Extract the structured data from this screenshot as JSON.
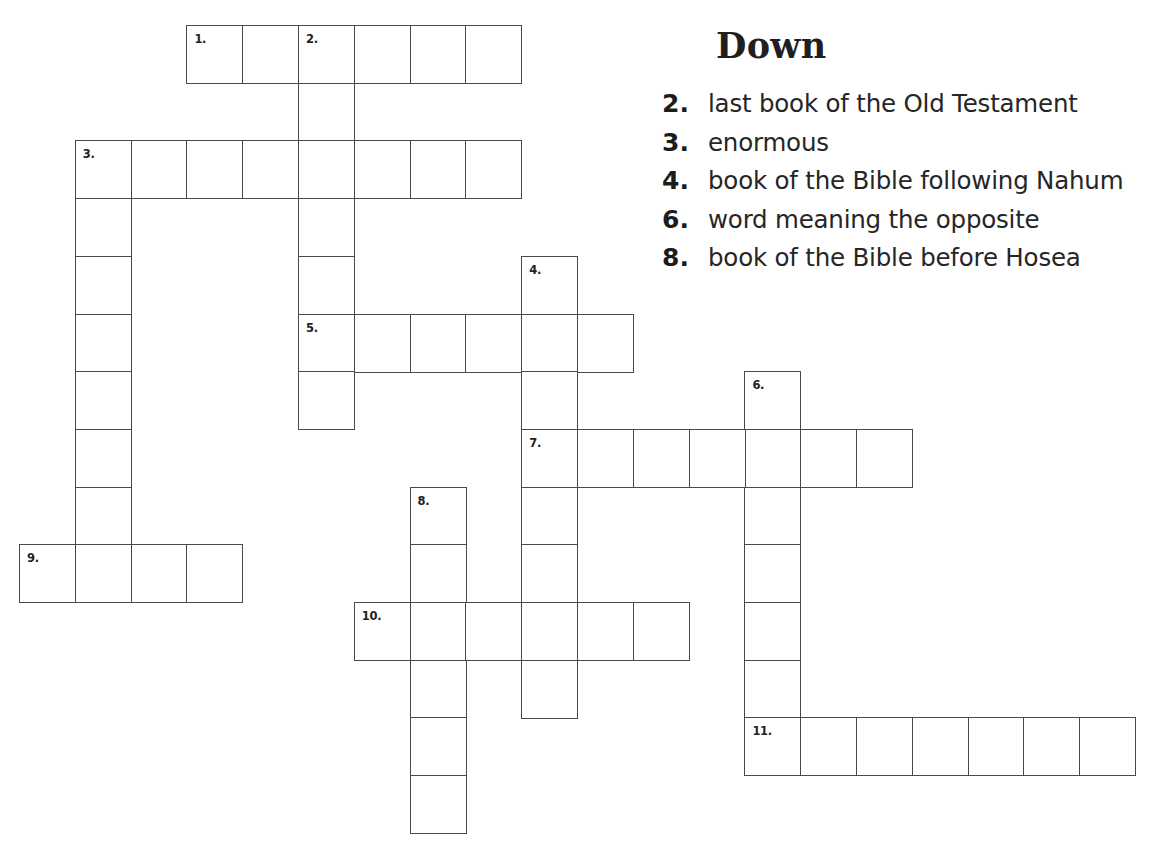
{
  "puzzle": {
    "grid_origin": {
      "x": 19,
      "y": 25
    },
    "cell_width": 55.8,
    "cell_height": 57.7,
    "border_color": "#4a4a4a",
    "entries": [
      {
        "number": "1.",
        "direction": "across",
        "row": 0,
        "col": 3,
        "length": 6
      },
      {
        "number": "2.",
        "direction": "down",
        "row": 0,
        "col": 5,
        "length": 7
      },
      {
        "number": "3.",
        "direction": "across",
        "row": 2,
        "col": 1,
        "length": 8
      },
      {
        "number": "3.",
        "direction": "down",
        "row": 2,
        "col": 1,
        "length": 8
      },
      {
        "number": "4.",
        "direction": "down",
        "row": 4,
        "col": 9,
        "length": 8
      },
      {
        "number": "5.",
        "direction": "across",
        "row": 5,
        "col": 5,
        "length": 6
      },
      {
        "number": "6.",
        "direction": "down",
        "row": 6,
        "col": 13,
        "length": 7
      },
      {
        "number": "7.",
        "direction": "across",
        "row": 7,
        "col": 9,
        "length": 7
      },
      {
        "number": "8.",
        "direction": "down",
        "row": 8,
        "col": 7,
        "length": 6
      },
      {
        "number": "9.",
        "direction": "across",
        "row": 9,
        "col": 0,
        "length": 4
      },
      {
        "number": "10.",
        "direction": "across",
        "row": 10,
        "col": 6,
        "length": 6
      },
      {
        "number": "11.",
        "direction": "across",
        "row": 12,
        "col": 13,
        "length": 7
      }
    ]
  },
  "clues": {
    "title": "Down",
    "items": [
      {
        "number": "2.",
        "text": "last book of the Old Testament"
      },
      {
        "number": "3.",
        "text": "enormous"
      },
      {
        "number": "4.",
        "text": "book of the Bible following Nahum"
      },
      {
        "number": "6.",
        "text": "word meaning the opposite"
      },
      {
        "number": "8.",
        "text": "book of the Bible before Hosea"
      }
    ]
  }
}
